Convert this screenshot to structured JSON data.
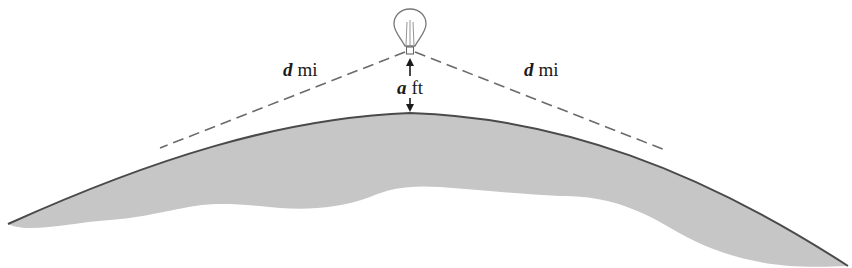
{
  "diagram": {
    "colors": {
      "earth_fill": "#c6c6c6",
      "earth_outline": "#4a4a4a",
      "dashed_line": "#6a6a6a",
      "balloon_stroke": "#777777",
      "text": "#1a1a1a"
    },
    "labels": {
      "left_distance": {
        "variable": "d",
        "unit": "mi"
      },
      "right_distance": {
        "variable": "d",
        "unit": "mi"
      },
      "height": {
        "variable": "a",
        "unit": "ft"
      }
    },
    "elements": [
      "balloon-icon",
      "earth-surface",
      "left-line-of-sight",
      "right-line-of-sight",
      "height-arrow-up",
      "height-arrow-down"
    ]
  }
}
